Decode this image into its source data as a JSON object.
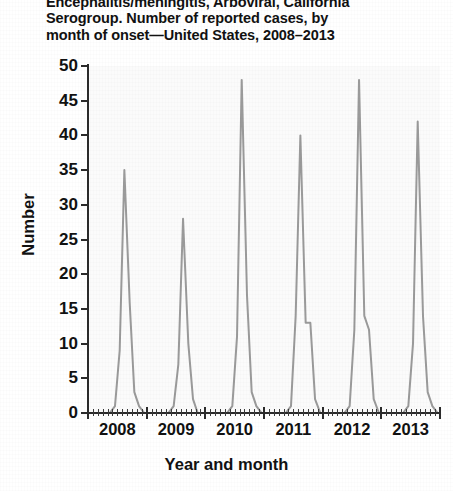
{
  "figure": {
    "title_line_1": "Encephalitis/meningitis, Arboviral, California",
    "title_line_2": "Serogroup. Number of reported cases, by",
    "title_line_3": "month of onset—United States, 2008–2013"
  },
  "chart_data": {
    "type": "line",
    "title": "Encephalitis/meningitis, Arboviral, California Serogroup. Number of reported cases, by month of onset—United States, 2008–2013",
    "xlabel": "Year and month",
    "ylabel": "Number",
    "ylim": [
      0,
      50
    ],
    "yticks": [
      0,
      5,
      10,
      15,
      20,
      25,
      30,
      35,
      40,
      45,
      50
    ],
    "ytick_labels": [
      "0",
      "5",
      "10",
      "15",
      "20",
      "25",
      "30",
      "35",
      "40",
      "45",
      "50"
    ],
    "xlim": [
      2008.0,
      2014.0
    ],
    "xtick_labels": [
      "2008",
      "2009",
      "2010",
      "2011",
      "2012",
      "2013"
    ],
    "xtick_positions": [
      2008.5,
      2009.5,
      2010.5,
      2011.5,
      2012.5,
      2013.5
    ],
    "minor_ticks_per_year": 12,
    "grid": false,
    "legend": null,
    "line_color": "#9a9a9a",
    "line_width": 2.0,
    "x_unit": "month of onset",
    "x": [
      2008.04,
      2008.12,
      2008.21,
      2008.29,
      2008.37,
      2008.46,
      2008.54,
      2008.62,
      2008.71,
      2008.79,
      2008.87,
      2008.96,
      2009.04,
      2009.12,
      2009.21,
      2009.29,
      2009.37,
      2009.46,
      2009.54,
      2009.62,
      2009.71,
      2009.79,
      2009.87,
      2009.96,
      2010.04,
      2010.12,
      2010.21,
      2010.29,
      2010.37,
      2010.46,
      2010.54,
      2010.62,
      2010.71,
      2010.79,
      2010.87,
      2010.96,
      2011.04,
      2011.12,
      2011.21,
      2011.29,
      2011.37,
      2011.46,
      2011.54,
      2011.62,
      2011.71,
      2011.79,
      2011.87,
      2011.96,
      2012.04,
      2012.12,
      2012.21,
      2012.29,
      2012.37,
      2012.46,
      2012.54,
      2012.62,
      2012.71,
      2012.79,
      2012.87,
      2012.96,
      2013.04,
      2013.12,
      2013.21,
      2013.29,
      2013.37,
      2013.46,
      2013.54,
      2013.62,
      2013.71,
      2013.79,
      2013.87,
      2013.96
    ],
    "values": [
      0,
      0,
      0,
      0,
      0,
      1,
      9,
      35,
      16,
      3,
      1,
      0,
      0,
      0,
      0,
      0,
      0,
      1,
      7,
      28,
      10,
      2,
      0,
      0,
      0,
      0,
      0,
      0,
      0,
      1,
      11,
      48,
      17,
      3,
      1,
      0,
      0,
      0,
      0,
      0,
      0,
      1,
      14,
      40,
      13,
      13,
      2,
      0,
      0,
      0,
      0,
      0,
      0,
      1,
      12,
      48,
      14,
      12,
      2,
      0,
      0,
      0,
      0,
      0,
      0,
      1,
      10,
      42,
      14,
      3,
      1,
      0
    ],
    "peaks": [
      {
        "year": 2008,
        "value": 35
      },
      {
        "year": 2009,
        "value": 28
      },
      {
        "year": 2010,
        "value": 48
      },
      {
        "year": 2011,
        "value": 40
      },
      {
        "year": 2012,
        "value": 48
      },
      {
        "year": 2013,
        "value": 42
      }
    ]
  }
}
